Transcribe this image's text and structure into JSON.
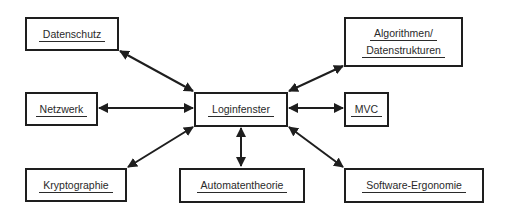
{
  "diagram": {
    "type": "hub-and-spoke",
    "center": {
      "id": "login",
      "label": "Loginfenster"
    },
    "nodes": {
      "datenschutz": {
        "label": "Datenschutz"
      },
      "algorithmen": {
        "line1": "Algorithmen/",
        "line2": "Datenstrukturen"
      },
      "netzwerk": {
        "label": "Netzwerk"
      },
      "login": {
        "label": "Loginfenster"
      },
      "mvc": {
        "label": "MVC"
      },
      "kryptographie": {
        "label": "Kryptographie"
      },
      "automatentheorie": {
        "label": "Automatentheorie"
      },
      "ergonomie": {
        "label": "Software-Ergonomie"
      }
    },
    "edges": [
      {
        "from": "login",
        "to": "datenschutz",
        "arrows": "both"
      },
      {
        "from": "login",
        "to": "algorithmen",
        "arrows": "both"
      },
      {
        "from": "login",
        "to": "netzwerk",
        "arrows": "both"
      },
      {
        "from": "login",
        "to": "mvc",
        "arrows": "both"
      },
      {
        "from": "login",
        "to": "kryptographie",
        "arrows": "both"
      },
      {
        "from": "login",
        "to": "automatentheorie",
        "arrows": "both"
      },
      {
        "from": "login",
        "to": "ergonomie",
        "arrows": "both"
      }
    ],
    "colors": {
      "line": "#1e1e1e",
      "text": "#2a2a2a",
      "background": "#ffffff"
    }
  }
}
